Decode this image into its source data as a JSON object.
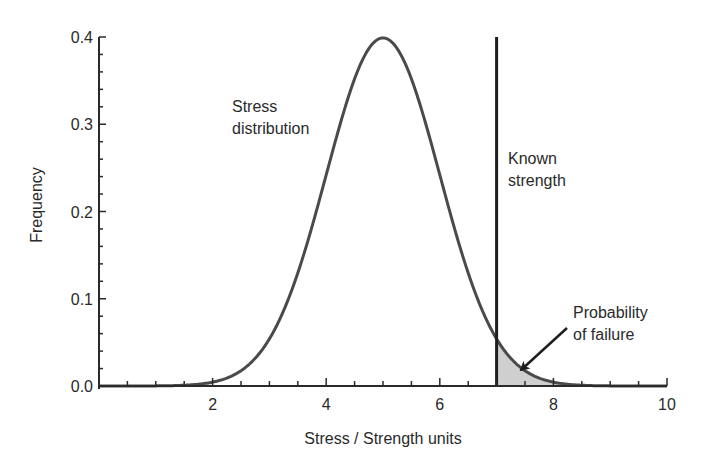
{
  "chart_data": {
    "type": "area",
    "title": "",
    "xlabel": "Stress / Strength units",
    "ylabel": "Frequency",
    "xlim": [
      0,
      10
    ],
    "ylim": [
      0,
      0.4
    ],
    "x_ticks": [
      2,
      4,
      6,
      8,
      10
    ],
    "x_tick_labels": [
      "2",
      "4",
      "6",
      "8",
      "10"
    ],
    "x_minor_tick_step": 0.5,
    "y_ticks": [
      0.0,
      0.1,
      0.2,
      0.3,
      0.4
    ],
    "y_tick_labels": [
      "0.0",
      "0.1",
      "0.2",
      "0.3",
      "0.4"
    ],
    "y_minor_tick_step": 0.02,
    "grid": false,
    "legend": null,
    "series": [
      {
        "name": "Stress distribution",
        "distribution": "normal",
        "mean": 5,
        "std": 1,
        "x": [
          0,
          1,
          2,
          2.5,
          3,
          3.5,
          4,
          4.5,
          5,
          5.5,
          6,
          6.5,
          7,
          7.5,
          8,
          8.5,
          9,
          10
        ],
        "values": [
          0.0,
          0.0001,
          0.0044,
          0.0175,
          0.054,
          0.1295,
          0.242,
          0.3521,
          0.3989,
          0.3521,
          0.242,
          0.1295,
          0.054,
          0.0175,
          0.0044,
          0.0009,
          0.0001,
          0.0
        ]
      }
    ],
    "vertical_line": {
      "name": "Known strength",
      "x": 7
    },
    "shaded_region": {
      "name": "Probability of failure",
      "x_from": 7,
      "x_to": 10,
      "fill": "#cfcfcf"
    },
    "annotations": [
      {
        "text_lines": [
          "Stress",
          "distribution"
        ],
        "x": 2.4,
        "y": 0.31
      },
      {
        "text_lines": [
          "Known",
          "strength"
        ],
        "x": 7.2,
        "y": 0.23
      },
      {
        "text_lines": [
          "Probability",
          "of failure"
        ],
        "x": 8.3,
        "y": 0.08,
        "arrow_to": [
          7.4,
          0.012
        ]
      }
    ]
  },
  "labels": {
    "xlabel": "Stress / Strength units",
    "ylabel": "Frequency",
    "stress_line1": "Stress",
    "stress_line2": "distribution",
    "strength_line1": "Known",
    "strength_line2": "strength",
    "failure_line1": "Probability",
    "failure_line2": "of failure"
  },
  "colors": {
    "curve": "#4a4a4a",
    "axis": "#2a2a2a",
    "shade": "#cfcfcf",
    "text": "#2a2a2a"
  }
}
